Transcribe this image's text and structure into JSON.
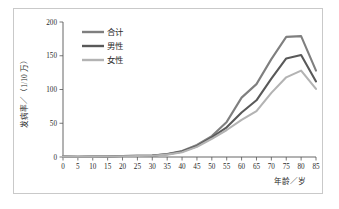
{
  "figure": {
    "background_color": "#ffffff",
    "frame_color": "#c9c9c9",
    "axis_color": "#555555"
  },
  "chart_data": {
    "type": "line",
    "title": "",
    "xlabel": "年龄／岁",
    "ylabel": "发病率／（1/10 万）",
    "xlim": [
      0,
      85
    ],
    "ylim": [
      0,
      200
    ],
    "xticks": [
      0,
      5,
      10,
      15,
      20,
      25,
      30,
      35,
      40,
      45,
      50,
      55,
      60,
      65,
      70,
      75,
      80,
      85
    ],
    "yticks": [
      0,
      50,
      100,
      150,
      200
    ],
    "grid": false,
    "legend_position": "upper-left-inside",
    "x": [
      0,
      5,
      10,
      15,
      20,
      25,
      30,
      35,
      40,
      45,
      50,
      55,
      60,
      65,
      70,
      75,
      80,
      85
    ],
    "series": [
      {
        "name": "合计",
        "color": "#7f7f7f",
        "values": [
          0.5,
          0.4,
          0.5,
          0.8,
          1.5,
          1.6,
          2.0,
          4.5,
          9.0,
          18.0,
          31.0,
          52.0,
          88.0,
          108.0,
          145.0,
          178.0,
          179.0,
          128.0
        ]
      },
      {
        "name": "男性",
        "color": "#595959",
        "values": [
          0.5,
          0.4,
          0.5,
          0.8,
          1.5,
          1.6,
          2.0,
          4.0,
          8.0,
          16.0,
          29.0,
          44.0,
          66.0,
          84.0,
          116.0,
          146.0,
          151.0,
          112.0
        ]
      },
      {
        "name": "女性",
        "color": "#b3b3b3",
        "values": [
          0.5,
          0.4,
          0.5,
          0.8,
          1.2,
          1.4,
          1.8,
          3.5,
          7.0,
          15.0,
          27.0,
          40.0,
          55.0,
          68.0,
          95.0,
          118.0,
          128.0,
          101.0
        ]
      }
    ]
  },
  "legend": {
    "items": [
      {
        "label": "合计",
        "color": "#7f7f7f"
      },
      {
        "label": "男性",
        "color": "#595959"
      },
      {
        "label": "女性",
        "color": "#b3b3b3"
      }
    ]
  }
}
